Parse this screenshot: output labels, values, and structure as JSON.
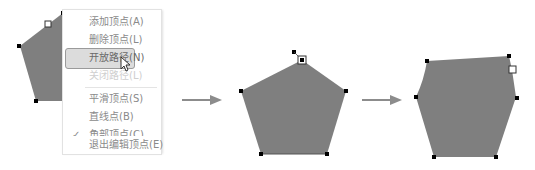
{
  "context_menu": {
    "items": [
      {
        "label": "添加顶点(A)",
        "state": "normal"
      },
      {
        "label": "删除顶点(L)",
        "state": "normal"
      },
      {
        "label": "开放路径(N)",
        "state": "hover"
      },
      {
        "label": "关闭路径(L)",
        "state": "disabled"
      },
      {
        "label": "平滑顶点(S)",
        "state": "normal"
      },
      {
        "label": "直线点(B)",
        "state": "normal"
      },
      {
        "label": "角部顶点(C)",
        "state": "checked"
      },
      {
        "label": "退出编辑顶点(E)",
        "state": "normal"
      }
    ],
    "check_glyph": "✓"
  },
  "steps": [
    {
      "name": "original-shape-with-menu"
    },
    {
      "name": "pentagon-open-path"
    },
    {
      "name": "edited-shape"
    }
  ],
  "colors": {
    "shape_fill": "#7f7f7f",
    "vertex_handle": "#000000",
    "arrow": "#8c8c8c",
    "menu_highlight": "#dcdcdc"
  }
}
